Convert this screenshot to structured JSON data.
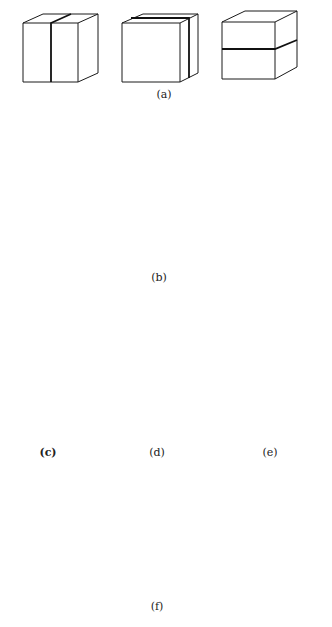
{
  "figure": {
    "labels": {
      "a": "(a)",
      "b": "(b)",
      "c": "(c)",
      "d": "(d)",
      "e": "(e)",
      "f": "(f)"
    },
    "panels": [
      {
        "id": "a",
        "content": "three cubes bisected by vertical/horizontal mirror planes"
      },
      {
        "id": "b",
        "content": "six cubes with diagonal mirror planes"
      },
      {
        "id": "c",
        "content": "cube with four-fold rotation axis"
      },
      {
        "id": "d",
        "content": "cube with three-fold rotation axis"
      },
      {
        "id": "e",
        "content": "cube with two-fold rotation axis"
      },
      {
        "id": "f",
        "content": "cube showing all symmetry axes"
      }
    ],
    "colors": {
      "line": "#1a1a1a",
      "background": "#ffffff"
    }
  }
}
